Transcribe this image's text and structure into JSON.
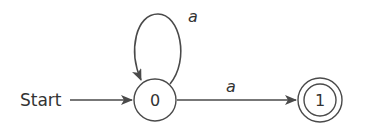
{
  "diagram": {
    "type": "finite-automaton",
    "start_label": "Start",
    "states": [
      {
        "id": "0",
        "label": "0",
        "accepting": false,
        "initial": true
      },
      {
        "id": "1",
        "label": "1",
        "accepting": true,
        "initial": false
      }
    ],
    "transitions": [
      {
        "from": "0",
        "to": "0",
        "label": "a",
        "kind": "self-loop"
      },
      {
        "from": "0",
        "to": "1",
        "label": "a",
        "kind": "straight"
      }
    ],
    "colors": {
      "stroke": "#4a4a4a",
      "text": "#333333",
      "background": "#ffffff"
    }
  }
}
